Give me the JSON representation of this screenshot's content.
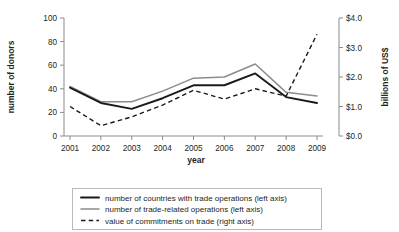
{
  "figure": {
    "title_cropped": "",
    "x_axis": {
      "label": "year",
      "ticks": [
        "2001",
        "2002",
        "2003",
        "2004",
        "2005",
        "2006",
        "2007",
        "2008",
        "2009"
      ]
    },
    "y_axis_left": {
      "label": "number of donors",
      "ticks": [
        "0",
        "20",
        "40",
        "60",
        "80",
        "100"
      ]
    },
    "y_axis_right": {
      "label": "billions of US$",
      "ticks": [
        "$0.0",
        "$1.0",
        "$2.0",
        "$3.0",
        "$4.0"
      ]
    },
    "legend": {
      "items": [
        {
          "label": "number of countries with trade operations (left axis)",
          "style": "solid-black"
        },
        {
          "label": "number of trade-related operations (left axis)",
          "style": "solid-gray"
        },
        {
          "label": "value of commitments on trade (right axis)",
          "style": "dashed-black"
        }
      ]
    },
    "colors": {
      "series_black": "#1a1a1a",
      "series_gray": "#8c8c8c",
      "axis": "#8b8b8b",
      "text": "#231f20",
      "background": "#ffffff"
    }
  },
  "chart_data": {
    "type": "line",
    "title": "",
    "xlabel": "year",
    "ylabel": "number of donors",
    "ylabel_secondary": "billions of US$",
    "grid": false,
    "legend_position": "bottom",
    "categories": [
      "2001",
      "2002",
      "2003",
      "2004",
      "2005",
      "2006",
      "2007",
      "2008",
      "2009"
    ],
    "ylim": [
      0,
      100
    ],
    "ylim_secondary": [
      0.0,
      4.0
    ],
    "ytick_values": [
      0,
      20,
      40,
      60,
      80,
      100
    ],
    "ytick_values_secondary": [
      0.0,
      1.0,
      2.0,
      3.0,
      4.0
    ],
    "series": [
      {
        "name": "number of countries with trade operations (left axis)",
        "axis": "left",
        "style": "solid",
        "color": "#1a1a1a",
        "values": [
          41,
          28,
          23,
          32,
          43,
          43,
          53,
          33,
          28
        ]
      },
      {
        "name": "number of trade-related operations (left axis)",
        "axis": "left",
        "style": "solid",
        "color": "#8c8c8c",
        "values": [
          42,
          29,
          29,
          38,
          49,
          50,
          61,
          37,
          34
        ]
      },
      {
        "name": "value of commitments on trade (right axis)",
        "axis": "right",
        "style": "dashed",
        "color": "#1a1a1a",
        "values": [
          1.0,
          0.35,
          0.65,
          1.05,
          1.55,
          1.25,
          1.6,
          1.35,
          3.45
        ]
      }
    ]
  }
}
